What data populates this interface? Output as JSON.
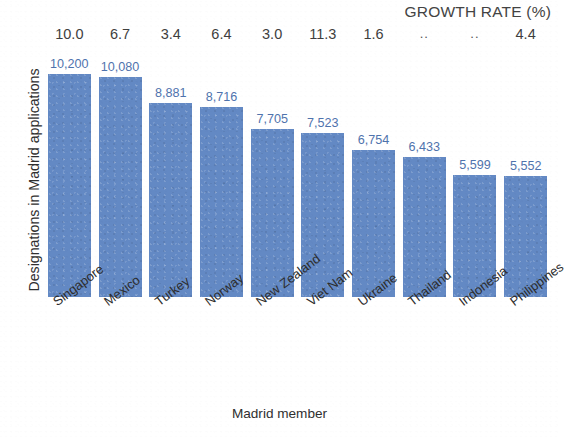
{
  "chart_data": {
    "type": "bar",
    "title": "",
    "xlabel": "Madrid member",
    "ylabel": "Designations in Madrid applications",
    "categories": [
      "Singapore",
      "Mexico",
      "Turkey",
      "Norway",
      "New Zealand",
      "Viet Nam",
      "Ukraine",
      "Thailand",
      "Indonesia",
      "Philippines"
    ],
    "values": [
      10200,
      10080,
      8881,
      8716,
      7705,
      7523,
      6754,
      6433,
      5599,
      5552
    ],
    "value_labels": [
      "10,200",
      "10,080",
      "8,881",
      "8,716",
      "7,705",
      "7,523",
      "6,754",
      "6,433",
      "5,599",
      "5,552"
    ],
    "secondary_axis_label": "GROWTH RATE (%)",
    "secondary_values": [
      "10.0",
      "6.7",
      "3.4",
      "6.4",
      "3.0",
      "11.3",
      "1.6",
      "..",
      "..",
      "4.4"
    ],
    "ylim": [
      0,
      11500
    ],
    "grid": false,
    "legend": "none",
    "bar_color": "#6389c4",
    "value_label_color": "#4f73ad"
  },
  "axes": {
    "y_title": "Designations in Madrid applications",
    "x_title": "Madrid member"
  },
  "header": {
    "growth_rate_title": "GROWTH RATE (%)"
  }
}
